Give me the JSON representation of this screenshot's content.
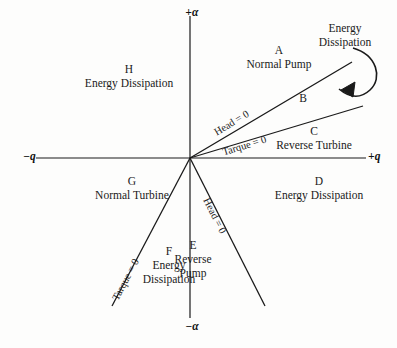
{
  "figure": {
    "background": "#fdfdfc",
    "line_color": "#1a1a1a"
  },
  "axes": {
    "positive_alpha": "+α",
    "negative_alpha": "−α",
    "positive_q": "+q",
    "negative_q": "−q",
    "origin": {
      "x": 190,
      "y": 158
    },
    "x_axis": {
      "x1": 36,
      "y1": 158,
      "x2": 366,
      "y2": 158
    },
    "y_axis": {
      "x1": 190,
      "y1": 16,
      "x2": 190,
      "y2": 318
    }
  },
  "curves": [
    {
      "id": "head-zero-upper",
      "label": "Head = 0",
      "x1": 190,
      "y1": 158,
      "x2": 352,
      "y2": 62,
      "label_x": 212,
      "label_y": 128,
      "label_rotation": -31
    },
    {
      "id": "torque-zero-upper",
      "label": "Tarque = 0",
      "x1": 190,
      "y1": 158,
      "x2": 363,
      "y2": 106,
      "label_x": 221,
      "label_y": 147,
      "label_rotation": -17
    },
    {
      "id": "torque-zero-lower",
      "label": "Tarque = 0",
      "x1": 190,
      "y1": 158,
      "x2": 112,
      "y2": 306,
      "label_x": 130,
      "label_y": 290,
      "label_rotation": -62
    },
    {
      "id": "head-zero-lower",
      "label": "Head = 0",
      "x1": 190,
      "y1": 158,
      "x2": 265,
      "y2": 306,
      "label_x": 215,
      "label_y": 196,
      "label_rotation": 63
    }
  ],
  "zones": [
    {
      "id": "A",
      "letter": "A",
      "name": "Normal Pump",
      "x": 236,
      "y": 44,
      "width": 86
    },
    {
      "id": "B",
      "letter": "B",
      "name": "",
      "x": 291,
      "y": 92,
      "width": 24
    },
    {
      "id": "C",
      "letter": "C",
      "name": "Reverse Turbine",
      "x": 262,
      "y": 125,
      "width": 104
    },
    {
      "id": "D",
      "letter": "D",
      "name": "Energy Dissipation",
      "x": 260,
      "y": 175,
      "width": 118
    },
    {
      "id": "E",
      "letter": "E",
      "name": "Reverse\nPump",
      "x": 165,
      "y": 239,
      "width": 56
    },
    {
      "id": "F",
      "letter": "F",
      "name": "Energy\nDissipation",
      "x": 133,
      "y": 245,
      "width": 72
    },
    {
      "id": "G",
      "letter": "G",
      "name": "Normal Turbine",
      "x": 78,
      "y": 175,
      "width": 108
    },
    {
      "id": "H",
      "letter": "H",
      "name": "Energy Dissipation",
      "x": 68,
      "y": 63,
      "width": 122
    }
  ],
  "annotation": {
    "id": "energy-dissipation-callout",
    "text": "Energy\nDissipation",
    "x": 300,
    "y": 22,
    "arrow": {
      "path": "M 353,48 C 377,55 383,78 370,90 C 357,102 345,94 339,89",
      "head": "M 339,89 L 350,84 L 348,95 Z"
    }
  }
}
